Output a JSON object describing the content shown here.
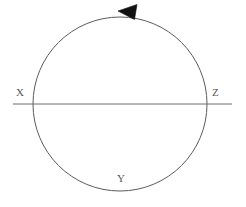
{
  "figure": {
    "type": "geometry-diagram",
    "background_color": "#ffffff",
    "stroke_color": "#5a5b5f",
    "arrow_color": "#111111",
    "label_color": "#55565a",
    "stroke_width": 1,
    "circle": {
      "center_x": 120,
      "center_y": 104,
      "radius": 87
    },
    "secant_line": {
      "y": 104,
      "x_start": 13,
      "x_end": 232
    },
    "arrow": {
      "name": "counterclockwise-direction-arrow",
      "direction": "counterclockwise",
      "tip_x": 118,
      "tip_y": 11,
      "points": "118,11 136,5 134,19"
    },
    "labels": {
      "x": "X",
      "y": "Y",
      "z": "Z"
    }
  }
}
